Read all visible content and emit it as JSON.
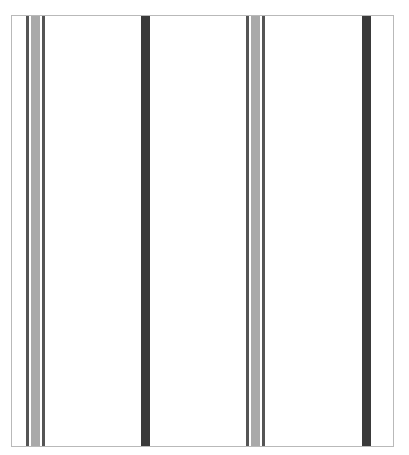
{
  "figure": {
    "width": 409,
    "height": 455,
    "background": "#ffffff",
    "frame": {
      "left": 11,
      "top": 15,
      "width": 383,
      "height": 432,
      "border_color": "#b9b9b9"
    },
    "stripes": [
      {
        "name": "stripe-group-1-left-line",
        "x": 26,
        "width": 3,
        "color": "#555555"
      },
      {
        "name": "stripe-group-1-center-band",
        "x": 31,
        "width": 9,
        "color": "#a9a9a9"
      },
      {
        "name": "stripe-group-1-right-line",
        "x": 42,
        "width": 3,
        "color": "#555555"
      },
      {
        "name": "solid-bar-1",
        "x": 141,
        "width": 9,
        "color": "#3a3a3a"
      },
      {
        "name": "stripe-group-2-left-line",
        "x": 246,
        "width": 3,
        "color": "#555555"
      },
      {
        "name": "stripe-group-2-center-band",
        "x": 251,
        "width": 9,
        "color": "#a9a9a9"
      },
      {
        "name": "stripe-group-2-right-line",
        "x": 262,
        "width": 3,
        "color": "#555555"
      },
      {
        "name": "solid-bar-2",
        "x": 362,
        "width": 9,
        "color": "#3a3a3a"
      }
    ]
  }
}
